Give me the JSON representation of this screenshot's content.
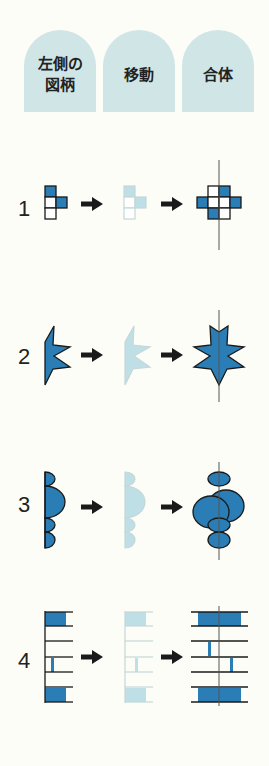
{
  "header": {
    "tabs": [
      {
        "label_line1": "左側の",
        "label_line2": "図柄"
      },
      {
        "label_line1": "移動",
        "label_line2": ""
      },
      {
        "label_line1": "合体",
        "label_line2": ""
      }
    ]
  },
  "rows": [
    {
      "number": "1",
      "shape": "grid-squares"
    },
    {
      "number": "2",
      "shape": "star-half"
    },
    {
      "number": "3",
      "shape": "bumps-half"
    },
    {
      "number": "4",
      "shape": "ladder-stripes"
    }
  ],
  "colors": {
    "tab_bg": "#cfe5e6",
    "fill_dark": "#2a7db5",
    "fill_light": "#bfdfe6",
    "stroke": "#1a1a1a",
    "background": "#fdfdf8"
  }
}
